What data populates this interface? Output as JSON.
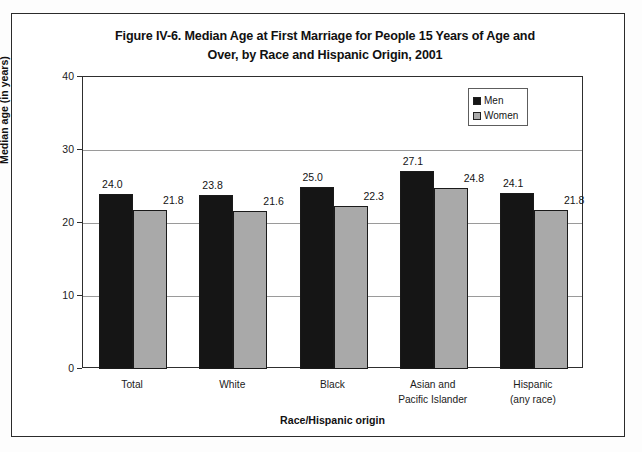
{
  "figure": {
    "title_lines": [
      "Figure IV-6. Median Age at First Marriage for People 15 Years of Age and",
      "Over, by Race and Hispanic Origin, 2001"
    ]
  },
  "colors": {
    "men": "#151515",
    "women": "#a9a9a9",
    "frame": "#2b2b2b",
    "gridline": "#9a9a9a"
  },
  "chart_data": {
    "type": "bar",
    "title": "Figure IV-6. Median Age at First Marriage for People 15 Years of Age and Over, by Race and Hispanic Origin, 2001",
    "xlabel": "Race/Hispanic origin",
    "ylabel": "Median age (in years)",
    "ylim": [
      0,
      40
    ],
    "yticks": [
      "0",
      "10",
      "20",
      "30",
      "40"
    ],
    "grid": true,
    "legend_position": "top-right",
    "categories": [
      {
        "lines": [
          "Total"
        ]
      },
      {
        "lines": [
          "White"
        ]
      },
      {
        "lines": [
          "Black"
        ]
      },
      {
        "lines": [
          "Asian and",
          "Pacific Islander"
        ]
      },
      {
        "lines": [
          "Hispanic",
          "(any race)"
        ]
      }
    ],
    "series": [
      {
        "name": "Men",
        "color": "#151515",
        "values": [
          24.0,
          23.8,
          25.0,
          27.1,
          24.1
        ],
        "labels": [
          "24.0",
          "23.8",
          "25.0",
          "27.1",
          "24.1"
        ]
      },
      {
        "name": "Women",
        "color": "#a9a9a9",
        "values": [
          21.8,
          21.6,
          22.3,
          24.8,
          21.8
        ],
        "labels": [
          "21.8",
          "21.6",
          "22.3",
          "24.8",
          "21.8"
        ]
      }
    ]
  }
}
